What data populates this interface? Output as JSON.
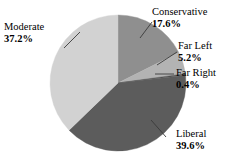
{
  "chart_data": {
    "type": "pie",
    "title": "",
    "subtitle": "",
    "xlabel": "",
    "ylabel": "",
    "legend_position": "none",
    "grid": false,
    "labels_show_percent": true,
    "start_angle_deg": 0,
    "direction": "clockwise",
    "categories": [
      "Conservative",
      "Far Left",
      "Far Right",
      "Liberal",
      "Moderate"
    ],
    "values": [
      17.6,
      5.2,
      0.4,
      39.6,
      37.2
    ],
    "units": "%",
    "total": 100.0,
    "slices": [
      {
        "label": "Conservative",
        "value": 17.6,
        "value_text": "17.6%",
        "color": "#8f8f8f"
      },
      {
        "label": "Far Left",
        "value": 5.2,
        "value_text": "5.2%",
        "color": "#b3b3b3"
      },
      {
        "label": "Far Right",
        "value": 0.4,
        "value_text": "0.4%",
        "color": "#4f4f4f"
      },
      {
        "label": "Liberal",
        "value": 39.6,
        "value_text": "39.6%",
        "color": "#5c5c5c"
      },
      {
        "label": "Moderate",
        "value": 37.2,
        "value_text": "37.2%",
        "color": "#d2d2d2"
      }
    ]
  },
  "labels": {
    "conservative": {
      "name": "Conservative",
      "percent": "17.6%"
    },
    "far_left": {
      "name": "Far Left",
      "percent": "5.2%"
    },
    "far_right": {
      "name": "Far Right",
      "percent": "0.4%"
    },
    "liberal": {
      "name": "Liberal",
      "percent": "39.6%"
    },
    "moderate": {
      "name": "Moderate",
      "percent": "37.2%"
    }
  },
  "colors": {
    "background": "#ffffff",
    "text": "#000000",
    "leader_line": "#3a3a3a",
    "slice_conservative": "#8f8f8f",
    "slice_far_left": "#b3b3b3",
    "slice_far_right": "#4f4f4f",
    "slice_liberal": "#5c5c5c",
    "slice_moderate": "#d2d2d2"
  }
}
